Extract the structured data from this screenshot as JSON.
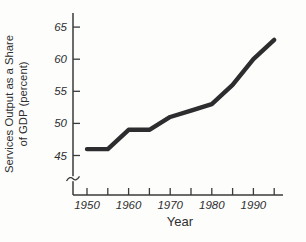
{
  "chart_data": {
    "type": "line",
    "title": "",
    "series_name": "Services output as a share of GDP",
    "x": [
      1950,
      1955,
      1960,
      1965,
      1970,
      1975,
      1980,
      1985,
      1990,
      1995
    ],
    "values": [
      46,
      46,
      49,
      49,
      51,
      52,
      53,
      56,
      60,
      63
    ],
    "xlabel": "Year",
    "ylabel": "Services Output as a Share of GDP (percent)",
    "ylabel_lines": [
      "Services Output as a Share",
      "of GDP (percent)"
    ],
    "y_ticks": [
      45,
      50,
      55,
      60,
      65
    ],
    "x_major_ticks": [
      1950,
      1960,
      1970,
      1980,
      1990
    ],
    "x_minor_ticks": [
      1955,
      1965,
      1975,
      1985,
      1995
    ],
    "ylim": [
      45,
      65
    ],
    "xlim": [
      1946.5,
      1997
    ],
    "grid": false,
    "legend": "none",
    "y_axis_break": true,
    "line_color": "#2d2d2f",
    "axis_color": "#3a3a3c",
    "background_color": "#fdfdfc"
  }
}
